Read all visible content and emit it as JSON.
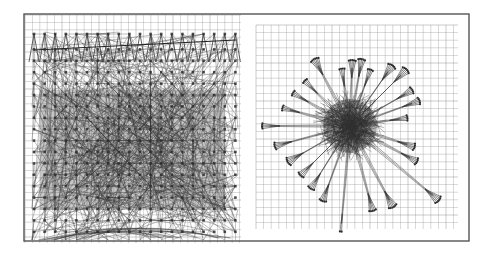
{
  "figure": {
    "width": 490,
    "height": 254,
    "background": "#ffffff",
    "frame": {
      "x": 24,
      "y": 14,
      "w": 445,
      "h": 227,
      "stroke": "#555555",
      "stroke_width": 1.4
    },
    "colors": {
      "grid": "#9a9a9a",
      "grid_major": "#7a7a7a",
      "edge": "#3a3a3a",
      "node": "#2e2e2e",
      "frame": "#555555"
    }
  },
  "panels": [
    {
      "id": "left",
      "label": "grid-based layout",
      "grid": {
        "x": 25,
        "y": 15,
        "w": 216,
        "h": 228,
        "spacing": 7.4
      },
      "layout": {
        "type": "grid-lattice",
        "origin_x": 34,
        "origin_y": 34,
        "cols": 20,
        "rows": 18,
        "step_x": 10.6,
        "step_y": 11.4,
        "edge_count": 900,
        "edge_opacity": 0.55,
        "top_long_edge": {
          "x1": 34,
          "y1": 50,
          "x2": 236,
          "y2": 40
        }
      }
    },
    {
      "id": "right",
      "label": "radial force-directed layout",
      "grid": {
        "x": 256,
        "y": 25,
        "w": 202,
        "h": 204,
        "spacing": 7.6
      },
      "layout": {
        "type": "radial-cluster",
        "center_x": 350,
        "center_y": 126,
        "core_radius": 30,
        "core_edge_count": 420,
        "spokes": [
          {
            "angle": -118,
            "length": 68,
            "fan": 6
          },
          {
            "angle": -98,
            "length": 50,
            "fan": 4
          },
          {
            "angle": -88,
            "length": 58,
            "fan": 5
          },
          {
            "angle": -80,
            "length": 60,
            "fan": 5
          },
          {
            "angle": -70,
            "length": 52,
            "fan": 4
          },
          {
            "angle": -55,
            "length": 66,
            "fan": 6
          },
          {
            "angle": -45,
            "length": 72,
            "fan": 6
          },
          {
            "angle": -30,
            "length": 64,
            "fan": 5
          },
          {
            "angle": -20,
            "length": 66,
            "fan": 5
          },
          {
            "angle": -8,
            "length": 50,
            "fan": 4
          },
          {
            "angle": 18,
            "length": 60,
            "fan": 5
          },
          {
            "angle": 28,
            "length": 68,
            "fan": 5
          },
          {
            "angle": 40,
            "length": 108,
            "fan": 6
          },
          {
            "angle": 62,
            "length": 84,
            "fan": 6
          },
          {
            "angle": 75,
            "length": 80,
            "fan": 5
          },
          {
            "angle": 95,
            "length": 98,
            "fan": 2
          },
          {
            "angle": 110,
            "length": 72,
            "fan": 5
          },
          {
            "angle": 122,
            "length": 66,
            "fan": 5
          },
          {
            "angle": 135,
            "length": 62,
            "fan": 5
          },
          {
            "angle": 150,
            "length": 64,
            "fan": 6
          },
          {
            "angle": 165,
            "length": 70,
            "fan": 5
          },
          {
            "angle": 180,
            "length": 80,
            "fan": 4
          },
          {
            "angle": 195,
            "length": 62,
            "fan": 4
          },
          {
            "angle": 210,
            "length": 58,
            "fan": 4
          },
          {
            "angle": 225,
            "length": 56,
            "fan": 4
          }
        ]
      }
    }
  ]
}
